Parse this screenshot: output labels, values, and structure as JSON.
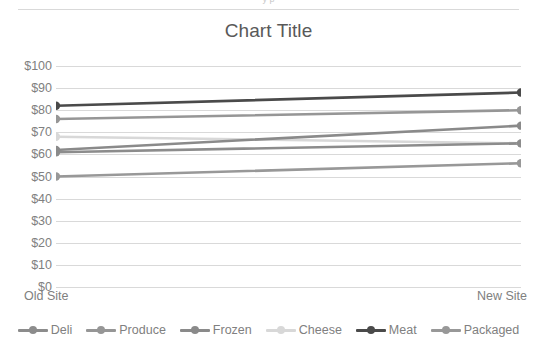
{
  "window": {
    "clipped_top_text": "y   p"
  },
  "chart": {
    "title": "Chart Title"
  },
  "axis": {
    "y_ticks": [
      "$100",
      "$90",
      "$80",
      "$70",
      "$60",
      "$50",
      "$40",
      "$30",
      "$20",
      "$10",
      "$0"
    ],
    "x_ticks": [
      "Old Site",
      "New Site"
    ]
  },
  "chart_data": {
    "type": "line",
    "title": "Chart Title",
    "xlabel": "",
    "ylabel": "",
    "categories": [
      "Old Site",
      "New Site"
    ],
    "ylim": [
      0,
      100
    ],
    "ytick_step": 10,
    "ytick_prefix": "$",
    "grid": true,
    "legend_position": "bottom",
    "markers": true,
    "series": [
      {
        "name": "Deli",
        "values": [
          61,
          65
        ],
        "color": "#8c8c8c"
      },
      {
        "name": "Produce",
        "values": [
          76,
          80
        ],
        "color": "#969696"
      },
      {
        "name": "Frozen",
        "values": [
          62,
          73
        ],
        "color": "#8a8a8a"
      },
      {
        "name": "Cheese",
        "values": [
          68,
          65
        ],
        "color": "#d8d8d8"
      },
      {
        "name": "Meat",
        "values": [
          82,
          88
        ],
        "color": "#4a4a4a"
      },
      {
        "name": "Packaged",
        "values": [
          50,
          56
        ],
        "color": "#989898"
      }
    ]
  },
  "colors": {
    "gridline": "#d9d9d9",
    "text": "#808080",
    "title": "#595959",
    "background": "#ffffff"
  }
}
